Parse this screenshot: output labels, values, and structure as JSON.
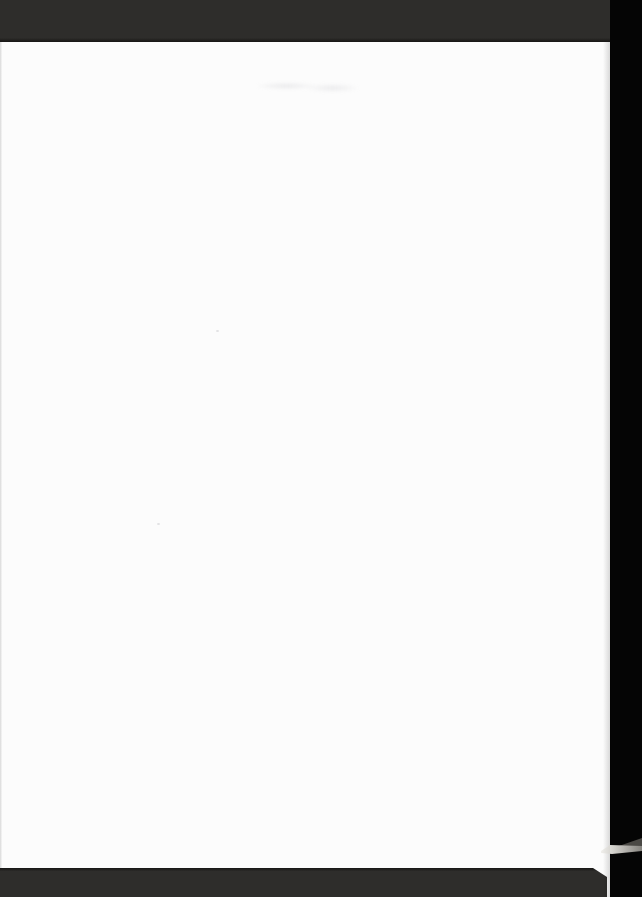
{
  "document": {
    "type": "scanned-page",
    "page_content_text": "",
    "note_visible_elements": "blank white page, dark scanner bands top and bottom, black strip on right, curled page corner visible in black strip near bottom right, faint ink bleed-through near top"
  },
  "colors": {
    "scanner-bed": "#050505",
    "band": "#2e2d2b",
    "band-edge": "#171615",
    "page": "#fcfcfc",
    "wedge-bright": "#eeece7",
    "wedge-mid": "#8a8884",
    "wedge-dark": "#4b4945"
  },
  "artifacts": [
    {
      "name": "top-scanner-band"
    },
    {
      "name": "bottom-scanner-band"
    },
    {
      "name": "right-black-strip"
    },
    {
      "name": "blank-page"
    },
    {
      "name": "page-corner-curl"
    },
    {
      "name": "ink-bleed-smudge"
    }
  ]
}
